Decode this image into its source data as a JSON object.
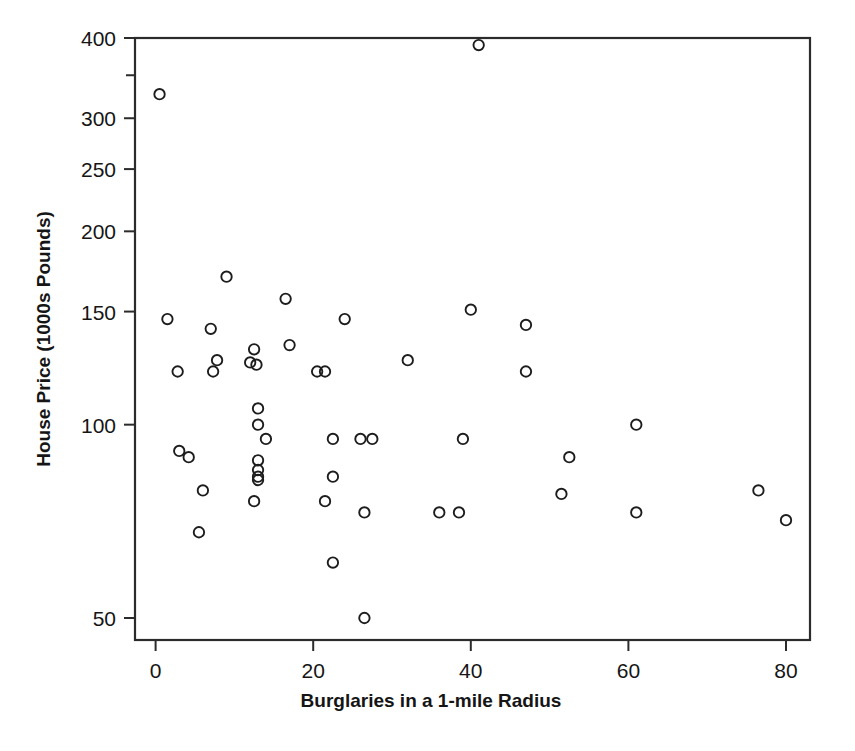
{
  "chart_data": {
    "type": "scatter",
    "title": "",
    "xlabel": "Burglaries in a 1-mile Radius",
    "ylabel": "House Price (1000s Pounds)",
    "xlim": [
      -2,
      83
    ],
    "ylim": [
      46,
      420
    ],
    "yscale": "log",
    "xscale": "linear",
    "grid": false,
    "legend": null,
    "xticks": [
      0,
      20,
      40,
      60,
      80
    ],
    "xtick_labels": [
      "0",
      "20",
      "40",
      "60",
      "80"
    ],
    "yticks": [
      50,
      100,
      150,
      200,
      250,
      300,
      400
    ],
    "ytick_labels": [
      "50",
      "100",
      "150",
      "200",
      "250",
      "300",
      "400"
    ],
    "marker": "open-circle",
    "marker_color": "#1d1d1d",
    "n_points": 54,
    "points": [
      {
        "x": 0.5,
        "y": 327
      },
      {
        "x": 41,
        "y": 390
      },
      {
        "x": 1.5,
        "y": 146
      },
      {
        "x": 9,
        "y": 170
      },
      {
        "x": 16.5,
        "y": 157
      },
      {
        "x": 24,
        "y": 146
      },
      {
        "x": 40,
        "y": 151
      },
      {
        "x": 47,
        "y": 143
      },
      {
        "x": 7,
        "y": 141
      },
      {
        "x": 2.8,
        "y": 121
      },
      {
        "x": 7.8,
        "y": 126
      },
      {
        "x": 7.3,
        "y": 121
      },
      {
        "x": 12.5,
        "y": 131
      },
      {
        "x": 12,
        "y": 125
      },
      {
        "x": 12.8,
        "y": 124
      },
      {
        "x": 17,
        "y": 133
      },
      {
        "x": 20.5,
        "y": 121
      },
      {
        "x": 21.5,
        "y": 121
      },
      {
        "x": 32,
        "y": 126
      },
      {
        "x": 47,
        "y": 121
      },
      {
        "x": 13,
        "y": 106
      },
      {
        "x": 13,
        "y": 100
      },
      {
        "x": 61,
        "y": 100
      },
      {
        "x": 14,
        "y": 95
      },
      {
        "x": 22.5,
        "y": 95
      },
      {
        "x": 26,
        "y": 95
      },
      {
        "x": 27.5,
        "y": 95
      },
      {
        "x": 39,
        "y": 95
      },
      {
        "x": 3,
        "y": 91
      },
      {
        "x": 4.2,
        "y": 89
      },
      {
        "x": 52.5,
        "y": 89
      },
      {
        "x": 13,
        "y": 88
      },
      {
        "x": 13,
        "y": 85
      },
      {
        "x": 13,
        "y": 83
      },
      {
        "x": 13,
        "y": 82
      },
      {
        "x": 22.5,
        "y": 83
      },
      {
        "x": 6,
        "y": 79
      },
      {
        "x": 51.5,
        "y": 78
      },
      {
        "x": 76.5,
        "y": 79
      },
      {
        "x": 12.5,
        "y": 76
      },
      {
        "x": 21.5,
        "y": 76
      },
      {
        "x": 26.5,
        "y": 73
      },
      {
        "x": 36,
        "y": 73
      },
      {
        "x": 38.5,
        "y": 73
      },
      {
        "x": 61,
        "y": 73
      },
      {
        "x": 80,
        "y": 71
      },
      {
        "x": 5.5,
        "y": 68
      },
      {
        "x": 22.5,
        "y": 61
      },
      {
        "x": 26.5,
        "y": 50
      }
    ]
  }
}
